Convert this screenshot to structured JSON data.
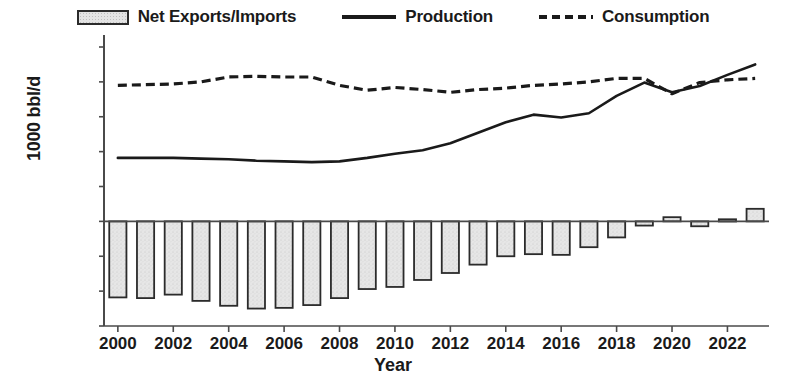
{
  "chart_data": {
    "type": "bar",
    "title": "",
    "xlabel": "Year",
    "ylabel": "1000 bbl/d",
    "ylim": [
      -15000,
      25000
    ],
    "ytick_values": [
      25000,
      20000,
      15000,
      10000,
      5000,
      0,
      -5000,
      -10000,
      -15000
    ],
    "ytick_labels": [
      "25000",
      "20000",
      "15000",
      "10000",
      "5000",
      "0",
      "-5000",
      "-10000",
      "-15000"
    ],
    "xlim": [
      1999.5,
      2023.5
    ],
    "xtick_labels": [
      "2000",
      "2002",
      "2004",
      "2006",
      "2008",
      "2010",
      "2012",
      "2014",
      "2016",
      "2018",
      "2020",
      "2022"
    ],
    "xtick_values": [
      2000,
      2002,
      2004,
      2006,
      2008,
      2010,
      2012,
      2014,
      2016,
      2018,
      2020,
      2022
    ],
    "grid": false,
    "legend_position": "top-center",
    "categories": [
      2000,
      2001,
      2002,
      2003,
      2004,
      2005,
      2006,
      2007,
      2008,
      2009,
      2010,
      2011,
      2012,
      2013,
      2014,
      2015,
      2016,
      2017,
      2018,
      2019,
      2020,
      2021,
      2022,
      2023
    ],
    "series": [
      {
        "name": "Net Exports/Imports",
        "type": "bar",
        "color": "#e3e3e3",
        "edge_color": "#2b2b2b",
        "values": [
          -10900,
          -11000,
          -10500,
          -11400,
          -12100,
          -12500,
          -12400,
          -12000,
          -11000,
          -9700,
          -9400,
          -8400,
          -7400,
          -6200,
          -5000,
          -4700,
          -4800,
          -3700,
          -2300,
          -600,
          600,
          -700,
          300,
          1800
        ]
      },
      {
        "name": "Production",
        "type": "line",
        "style": "solid",
        "color": "#1a1a1a",
        "values": [
          9100,
          9100,
          9100,
          9000,
          8900,
          8700,
          8600,
          8500,
          8600,
          9100,
          9700,
          10200,
          11200,
          12700,
          14200,
          15300,
          14900,
          15500,
          18000,
          19900,
          18500,
          19400,
          21000,
          22500
        ]
      },
      {
        "name": "Consumption",
        "type": "line",
        "style": "dashed",
        "color": "#1a1a1a",
        "values": [
          19500,
          19600,
          19700,
          20000,
          20700,
          20800,
          20700,
          20700,
          19500,
          18800,
          19200,
          18900,
          18500,
          18900,
          19100,
          19500,
          19700,
          20000,
          20500,
          20500,
          18300,
          19900,
          20300,
          20500
        ]
      }
    ]
  },
  "legend": {
    "items": [
      {
        "label": "Net Exports/Imports",
        "marker": "bar-swatch"
      },
      {
        "label": "Production",
        "marker": "solid-line"
      },
      {
        "label": "Consumption",
        "marker": "dashed-line"
      }
    ]
  },
  "axes": {
    "y_title": "1000 bbl/d",
    "x_title": "Year"
  }
}
